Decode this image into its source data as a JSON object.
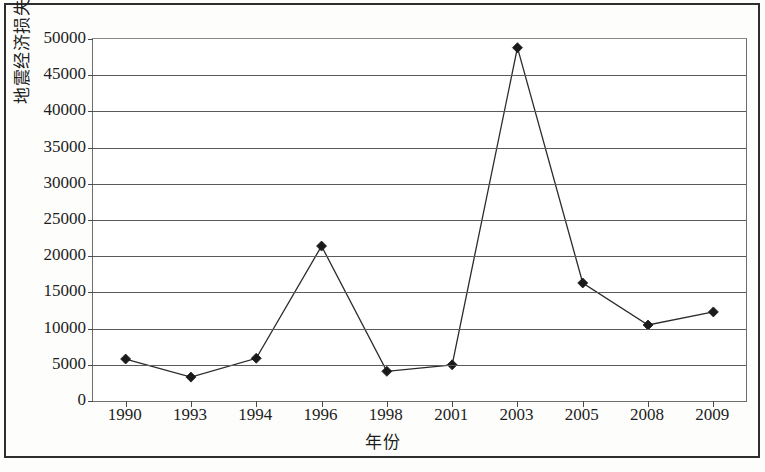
{
  "chart_data": {
    "type": "line",
    "title": "",
    "xlabel": "年份",
    "ylabel": "地震经济损失/万元",
    "categories": [
      "1990",
      "1993",
      "1994",
      "1996",
      "1998",
      "2001",
      "2003",
      "2005",
      "2008",
      "2009"
    ],
    "values": [
      5800,
      3300,
      5900,
      21400,
      4100,
      5000,
      48800,
      16300,
      10500,
      12300
    ],
    "series": [
      {
        "name": "地震经济损失",
        "values": [
          5800,
          3300,
          5900,
          21400,
          4100,
          5000,
          48800,
          16300,
          10500,
          12300
        ]
      }
    ],
    "ylim": [
      0,
      50000
    ],
    "ytick_labels": [
      "0",
      "5000",
      "10000",
      "15000",
      "20000",
      "25000",
      "30000",
      "35000",
      "40000",
      "45000",
      "50000"
    ],
    "ytick_values": [
      0,
      5000,
      10000,
      15000,
      20000,
      25000,
      30000,
      35000,
      40000,
      45000,
      50000
    ],
    "ytick_step": 5000,
    "grid": true,
    "grid_axis": "y",
    "legend": false,
    "legend_position": "none",
    "marker": "diamond",
    "line_color": "#2b2b2b",
    "marker_color": "#1a1a1a",
    "grid_color": "#5a5a5a",
    "plot_background": "#ffffff",
    "border_color": "#2e2e2e"
  }
}
